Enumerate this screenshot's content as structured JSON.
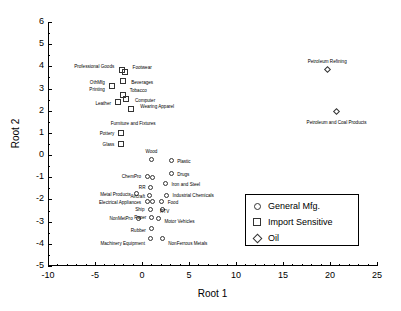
{
  "chart_data": {
    "type": "scatter",
    "title": "",
    "xlabel": "Root 1",
    "ylabel": "Root 2",
    "xlim": [
      -10,
      25
    ],
    "ylim": [
      -5,
      6
    ],
    "xticks": [
      -10,
      -5,
      0,
      5,
      10,
      15,
      20,
      25
    ],
    "yticks": [
      6,
      5,
      4,
      3,
      2,
      1,
      0,
      -1,
      -2,
      -3,
      -4,
      -5
    ],
    "grid": false,
    "legend_position": "center-right",
    "series": [
      {
        "name": "General Mfg.",
        "marker": "circle",
        "points": [
          {
            "label": "Wood",
            "x": 1.0,
            "y": -0.2,
            "label_dx": 0,
            "label_dy": -7,
            "anchor": "middle"
          },
          {
            "label": "Plastic",
            "x": 3.1,
            "y": -0.25,
            "label_dx": 6,
            "label_dy": 2,
            "anchor": "start"
          },
          {
            "label": "Drugs",
            "x": 3.1,
            "y": -0.85,
            "label_dx": 6,
            "label_dy": 2,
            "anchor": "start"
          },
          {
            "label": "ChemPro",
            "x": 0.55,
            "y": -0.95,
            "label_dx": -6,
            "label_dy": 2,
            "anchor": "end"
          },
          {
            "label": "",
            "x": 1.15,
            "y": -1.0,
            "label_dx": 0,
            "label_dy": 0,
            "anchor": "middle"
          },
          {
            "label": "Iron and Steel",
            "x": 2.5,
            "y": -1.3,
            "label_dx": 6,
            "label_dy": 2,
            "anchor": "start"
          },
          {
            "label": "RR",
            "x": 0.9,
            "y": -1.45,
            "label_dx": -5,
            "label_dy": 2,
            "anchor": "end"
          },
          {
            "label": "Metal Products",
            "x": -0.55,
            "y": -1.75,
            "label_dx": -6,
            "label_dy": 2,
            "anchor": "end"
          },
          {
            "label": "Aircraft",
            "x": 0.85,
            "y": -1.8,
            "label_dx": -5,
            "label_dy": 3,
            "anchor": "end"
          },
          {
            "label": "Industrial Chemicals",
            "x": 2.6,
            "y": -1.8,
            "label_dx": 6,
            "label_dy": 2,
            "anchor": "start"
          },
          {
            "label": "Electrical Appliances",
            "x": 0.55,
            "y": -2.1,
            "label_dx": -6,
            "label_dy": 2,
            "anchor": "end"
          },
          {
            "label": "",
            "x": 1.1,
            "y": -2.1,
            "label_dx": 0,
            "label_dy": 0,
            "anchor": "middle"
          },
          {
            "label": "Food",
            "x": 2.1,
            "y": -2.1,
            "label_dx": 6,
            "label_dy": 2,
            "anchor": "start"
          },
          {
            "label": "Ship",
            "x": 0.9,
            "y": -2.45,
            "label_dx": -6,
            "label_dy": 2,
            "anchor": "end"
          },
          {
            "label": "RTV",
            "x": 2.2,
            "y": -2.45,
            "label_dx": 2,
            "label_dy": 4,
            "anchor": "middle"
          },
          {
            "label": "NonMetPro",
            "x": -0.35,
            "y": -2.85,
            "label_dx": -6,
            "label_dy": 2,
            "anchor": "end"
          },
          {
            "label": "Paper",
            "x": 1.0,
            "y": -2.8,
            "label_dx": -5,
            "label_dy": 2,
            "anchor": "end"
          },
          {
            "label": "Motor Vehicles",
            "x": 1.75,
            "y": -2.85,
            "label_dx": 6,
            "label_dy": 5,
            "anchor": "start"
          },
          {
            "label": "Rubber",
            "x": 1.05,
            "y": -3.3,
            "label_dx": -6,
            "label_dy": 4,
            "anchor": "end"
          },
          {
            "label": "Machinery Equipment",
            "x": 0.95,
            "y": -3.75,
            "label_dx": -6,
            "label_dy": 7,
            "anchor": "end"
          },
          {
            "label": "NonFerrous Metals",
            "x": 2.15,
            "y": -3.75,
            "label_dx": 6,
            "label_dy": 7,
            "anchor": "start"
          }
        ]
      },
      {
        "name": "Import Sensitive",
        "marker": "square",
        "points": [
          {
            "label": "Professional Goods",
            "x": -2.1,
            "y": 3.85,
            "label_dx": -8,
            "label_dy": -2,
            "anchor": "end"
          },
          {
            "label": "Footwear",
            "x": -1.85,
            "y": 3.75,
            "label_dx": 8,
            "label_dy": -3,
            "anchor": "start"
          },
          {
            "label": "Beverages",
            "x": -2.0,
            "y": 3.35,
            "label_dx": 8,
            "label_dy": 3,
            "anchor": "start"
          },
          {
            "label": "OthMfg",
            "x": -3.2,
            "y": 3.1,
            "label_dx": -7,
            "label_dy": -2,
            "anchor": "end"
          },
          {
            "label": "Printing",
            "x": -3.2,
            "y": 3.1,
            "label_dx": -7,
            "label_dy": 5,
            "anchor": "end"
          },
          {
            "label": "Tobacco",
            "x": -2.05,
            "y": 2.7,
            "label_dx": 7,
            "label_dy": -3,
            "anchor": "start"
          },
          {
            "label": "Computer",
            "x": -1.7,
            "y": 2.55,
            "label_dx": 9,
            "label_dy": 3,
            "anchor": "start"
          },
          {
            "label": "Leather",
            "x": -2.55,
            "y": 2.4,
            "label_dx": -7,
            "label_dy": 3,
            "anchor": "end"
          },
          {
            "label": "Wearing Apparel",
            "x": -1.15,
            "y": 2.1,
            "label_dx": 9,
            "label_dy": -1,
            "anchor": "start"
          },
          {
            "label": "Furniture and Fixtures",
            "x": -1.15,
            "y": 2.1,
            "label_dx": 2,
            "label_dy": 16,
            "anchor": "middle"
          },
          {
            "label": "Pottery",
            "x": -2.2,
            "y": 1.0,
            "label_dx": -7,
            "label_dy": 2,
            "anchor": "end"
          },
          {
            "label": "Glass",
            "x": -2.2,
            "y": 0.5,
            "label_dx": -7,
            "label_dy": 2,
            "anchor": "end"
          }
        ]
      },
      {
        "name": "Oil",
        "marker": "diamond",
        "points": [
          {
            "label": "Petroleum Refining",
            "x": 19.7,
            "y": 3.85,
            "label_dx": 0,
            "label_dy": -7,
            "anchor": "middle"
          },
          {
            "label": "Petroleum and Coal Products",
            "x": 20.7,
            "y": 1.95,
            "label_dx": 0,
            "label_dy": 12,
            "anchor": "middle"
          }
        ]
      }
    ]
  },
  "legend": {
    "entries": [
      {
        "symbol": "circle-marker",
        "label": "General Mfg."
      },
      {
        "symbol": "square-marker",
        "label": "Import Sensitive"
      },
      {
        "symbol": "diamond-marker",
        "label": "Oil"
      }
    ]
  }
}
